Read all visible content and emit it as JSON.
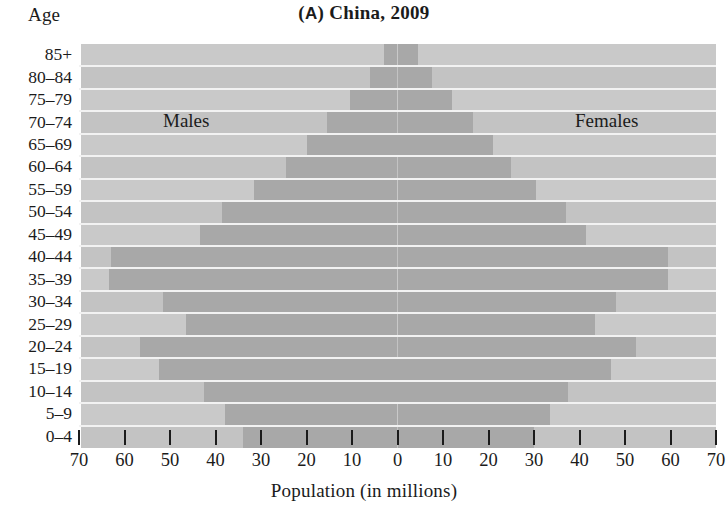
{
  "chart_data": {
    "type": "bar",
    "subtype": "population-pyramid",
    "title": "(A) China, 2009",
    "panel_letter": "A",
    "title_text": "China, 2009",
    "xlabel": "Population (in millions)",
    "ylabel": "Age",
    "xlim": [
      -70,
      70
    ],
    "xticks": [
      70,
      60,
      50,
      40,
      30,
      20,
      10,
      0,
      10,
      20,
      30,
      40,
      50,
      60,
      70
    ],
    "xtick_values": [
      -70,
      -60,
      -50,
      -40,
      -30,
      -20,
      -10,
      0,
      10,
      20,
      30,
      40,
      50,
      60,
      70
    ],
    "grid": false,
    "legend_position": "inside-plot",
    "categories": [
      "85+",
      "80–84",
      "75–79",
      "70–74",
      "65–69",
      "60–64",
      "55–59",
      "50–54",
      "45–49",
      "40–44",
      "35–39",
      "30–34",
      "25–29",
      "20–24",
      "15–19",
      "10–14",
      "5–9",
      "0–4"
    ],
    "series": [
      {
        "name": "Males",
        "side": "left",
        "color": "#a8a8a8",
        "values": [
          3.0,
          6.0,
          10.5,
          15.5,
          20.0,
          24.5,
          31.5,
          38.5,
          43.5,
          63.0,
          63.5,
          51.5,
          46.5,
          56.5,
          52.5,
          42.5,
          38.0,
          34.0
        ]
      },
      {
        "name": "Females",
        "side": "right",
        "color": "#a8a8a8",
        "values": [
          4.5,
          7.5,
          12.0,
          16.5,
          21.0,
          25.0,
          30.5,
          37.0,
          41.5,
          59.5,
          59.5,
          48.0,
          43.5,
          52.5,
          47.0,
          37.5,
          33.5,
          30.0
        ]
      }
    ]
  },
  "labels": {
    "axis_y_title": "Age",
    "axis_x_title": "Population (in millions)",
    "males": "Males",
    "females": "Females",
    "panel_prefix": "(",
    "panel_letter": "A",
    "panel_suffix": ")",
    "title_rest": " China, 2009"
  },
  "colors": {
    "background": "#ffffff",
    "plot_background": "#c9c9c9",
    "band_alt": "#c3c3c3",
    "bar": "#a8a8a8",
    "center_line": "#ffffff",
    "separator": "#f2f2f2",
    "text": "#1b1b1b"
  }
}
